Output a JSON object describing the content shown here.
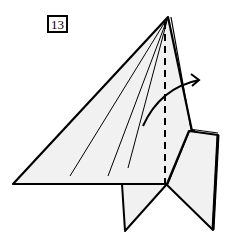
{
  "step": {
    "number": "13"
  },
  "diagram": {
    "type": "origami-fold-step",
    "paper_fill": "#f1f1f1",
    "line_color": "#000000",
    "elements": [
      "step-number-box",
      "main-triangle-flap",
      "crease-lines",
      "valley-fold-dashed-line",
      "fold-direction-arrow",
      "lower-left-flap",
      "lower-right-flap",
      "layered-right-edge"
    ]
  }
}
